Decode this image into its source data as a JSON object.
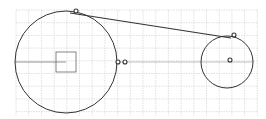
{
  "diagram": {
    "type": "geometry-construction",
    "background": "#ffffff",
    "grid": {
      "color": "#d4d4d4",
      "x_start": 16,
      "x_end": 257,
      "y_start": 10,
      "y_end": 116,
      "spacing": 12.7
    },
    "stroke_color": "#333333",
    "large_circle": {
      "cx": 66,
      "cy": 62,
      "r": 51
    },
    "small_circle": {
      "cx": 227,
      "cy": 62,
      "r": 26
    },
    "tangent_line": {
      "x1": 70,
      "y1": 13,
      "x2": 231,
      "y2": 38
    },
    "square": {
      "x": 56,
      "y": 52,
      "size": 20
    },
    "radius_line": {
      "x1": 15,
      "y1": 62,
      "x2": 66,
      "y2": 62
    },
    "axis_line": {
      "x1": 117,
      "y1": 62,
      "x2": 253,
      "y2": 62
    },
    "points": [
      {
        "name": "tangent-point-large",
        "cx": 76,
        "cy": 11
      },
      {
        "name": "tangent-point-small",
        "cx": 234,
        "cy": 35
      },
      {
        "name": "marker-a",
        "cx": 118,
        "cy": 62
      },
      {
        "name": "marker-b",
        "cx": 125,
        "cy": 62
      },
      {
        "name": "small-circle-center",
        "cx": 230,
        "cy": 60
      }
    ]
  }
}
